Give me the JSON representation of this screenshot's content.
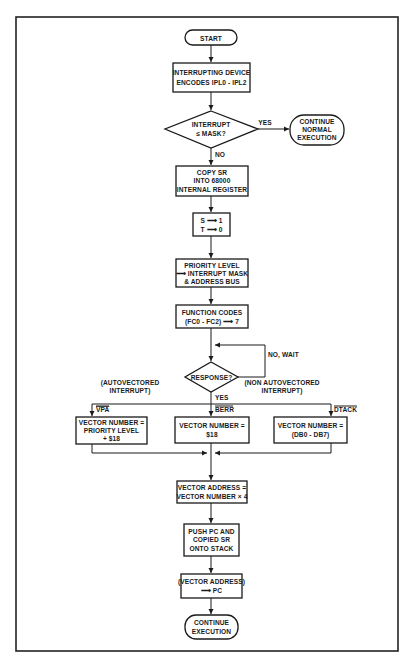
{
  "diagram": {
    "type": "flowchart",
    "nodes": {
      "start": {
        "shape": "terminal",
        "lines": [
          "START"
        ]
      },
      "encode": {
        "shape": "process",
        "lines": [
          "INTERRUPTING DEVICE",
          "ENCODES IPL0 - IPL2"
        ]
      },
      "mask_check": {
        "shape": "decision",
        "lines": [
          "INTERRUPT",
          "≤ MASK?"
        ]
      },
      "continue_normal": {
        "shape": "terminal",
        "lines": [
          "CONTINUE",
          "NORMAL",
          "EXECUTION"
        ]
      },
      "copy_sr": {
        "shape": "process",
        "lines": [
          "COPY SR",
          "INTO 68000",
          "INTERNAL REGISTER"
        ]
      },
      "set_st": {
        "shape": "process",
        "lines": [
          "S ⟶ 1",
          "T ⟶ 0"
        ]
      },
      "priority": {
        "shape": "process",
        "lines": [
          "PRIORITY LEVEL",
          "⟶ INTERRUPT MASK",
          "& ADDRESS BUS"
        ]
      },
      "function_codes": {
        "shape": "process",
        "lines": [
          "FUNCTION CODES",
          "(FC0 - FC2) ⟶ 7"
        ]
      },
      "response": {
        "shape": "decision",
        "lines": [
          "RESPONSE?"
        ]
      },
      "vec_auto": {
        "shape": "process",
        "lines": [
          "VECTOR NUMBER =",
          "PRIORITY LEVEL",
          "+ $18"
        ]
      },
      "vec_berr": {
        "shape": "process",
        "lines": [
          "VECTOR NUMBER =",
          "$18"
        ]
      },
      "vec_dtack": {
        "shape": "process",
        "lines": [
          "VECTOR NUMBER =",
          "(DB0 - DB7)"
        ]
      },
      "vec_addr": {
        "shape": "process",
        "lines": [
          "VECTOR ADDRESS =",
          "VECTOR NUMBER × 4"
        ]
      },
      "push": {
        "shape": "process",
        "lines": [
          "PUSH PC AND",
          "COPIED SR",
          "ONTO STACK"
        ]
      },
      "load_pc": {
        "shape": "process",
        "lines": [
          "(VECTOR ADDRESS)",
          "⟶ PC"
        ]
      },
      "continue_exec": {
        "shape": "terminal",
        "lines": [
          "CONTINUE",
          "EXECUTION"
        ]
      }
    },
    "edge_labels": {
      "yes_mask": "YES",
      "no_mask": "NO",
      "no_wait": "NO, WAIT",
      "yes_response": "YES",
      "autovectored": [
        "(AUTOVECTORED",
        "INTERRUPT)"
      ],
      "non_autovectored": [
        "(NON AUTOVECTORED",
        "INTERRUPT)"
      ],
      "vpa": "VPA",
      "berr": "BERR",
      "dtack": "DTACK"
    },
    "edges": [
      [
        "start",
        "encode"
      ],
      [
        "encode",
        "mask_check"
      ],
      [
        "mask_check",
        "continue_normal",
        "YES"
      ],
      [
        "mask_check",
        "copy_sr",
        "NO"
      ],
      [
        "copy_sr",
        "set_st"
      ],
      [
        "set_st",
        "priority"
      ],
      [
        "priority",
        "function_codes"
      ],
      [
        "function_codes",
        "response"
      ],
      [
        "response",
        "response",
        "NO, WAIT"
      ],
      [
        "response",
        "vec_auto",
        "VPA"
      ],
      [
        "response",
        "vec_berr",
        "BERR"
      ],
      [
        "response",
        "vec_dtack",
        "DTACK"
      ],
      [
        "vec_auto",
        "vec_addr"
      ],
      [
        "vec_berr",
        "vec_addr"
      ],
      [
        "vec_dtack",
        "vec_addr"
      ],
      [
        "vec_addr",
        "push"
      ],
      [
        "push",
        "load_pc"
      ],
      [
        "load_pc",
        "continue_exec"
      ]
    ]
  }
}
